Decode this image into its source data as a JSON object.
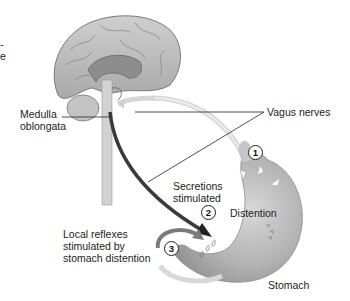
{
  "diagram": {
    "labels": {
      "medulla": [
        "Medulla",
        "oblongata"
      ],
      "vagus": "Vagus nerves",
      "secretions": [
        "Secretions",
        "stimulated"
      ],
      "distention": "Distention",
      "local_reflexes": [
        "Local reflexes",
        "stimulated by",
        "stomach distention"
      ],
      "stomach": "Stomach",
      "cropped_left_fragment": [
        "-",
        "e"
      ]
    },
    "steps": [
      {
        "number": "1",
        "meaning": "Distention signal to medulla"
      },
      {
        "number": "2",
        "meaning": "Secretions stimulated via vagus"
      },
      {
        "number": "3",
        "meaning": "Local reflexes"
      }
    ],
    "colors": {
      "brain": "#bdbdbd",
      "brain_outline": "#7a7a7a",
      "afferent_nerve": "#d6d6d6",
      "efferent_nerve": "#3a3a3a",
      "stomach": "#b9b9b9",
      "line": "#222222"
    }
  }
}
